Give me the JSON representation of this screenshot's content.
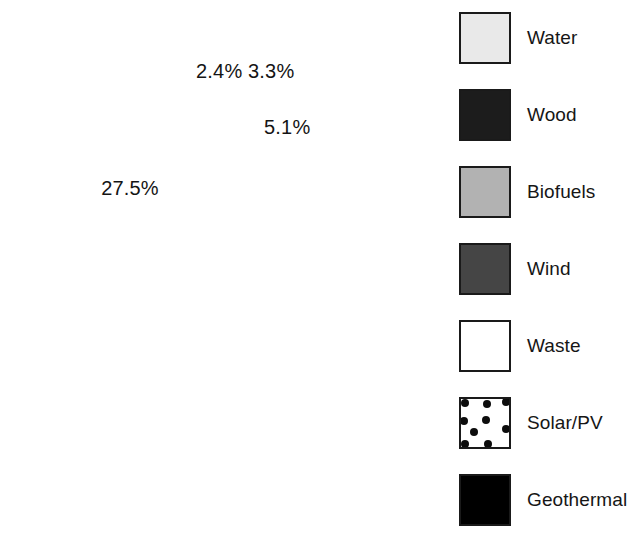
{
  "chart_data": {
    "type": "pie",
    "title": "",
    "categories": [
      "Geothermal",
      "Solar/PV",
      "Waste",
      "Wind",
      "Biofuels",
      "Wood",
      "Water"
    ],
    "values": [
      2.4,
      3.3,
      5.1,
      17.2,
      21.5,
      23.0,
      27.5
    ],
    "value_labels": [
      "2.4%",
      "3.3%",
      "5.1%",
      "17.2%",
      "21.5%",
      "23.0%",
      "27.5%"
    ],
    "unit": "%",
    "start_angle_deg": 0,
    "direction": "clockwise",
    "legend_position": "right",
    "grid": false,
    "slice_colors": [
      "#000000",
      "#ffffff",
      "#ffffff",
      "#454545",
      "#b2b2b2",
      "#1c1c1c",
      "#e9e9e9"
    ],
    "slice_patterns": [
      "solid",
      "dots",
      "solid",
      "solid",
      "solid",
      "solid",
      "solid"
    ],
    "label_text_colors": [
      "#141414",
      "#141414",
      "#141414",
      "#ffffff",
      "#ffffff",
      "#ffffff",
      "#141414"
    ],
    "label_placement": [
      "outside",
      "outside",
      "outside",
      "inside",
      "inside",
      "inside",
      "inside"
    ]
  },
  "pie": {
    "center_x": 211,
    "center_y": 271,
    "radius": 187,
    "outline_color": "#1a1a1a",
    "outside_labels": [
      {
        "name": "geothermal",
        "text": "2.4%",
        "x": 196,
        "y": 60
      },
      {
        "name": "solar-pv",
        "text": "3.3%",
        "x": 248,
        "y": 60
      },
      {
        "name": "waste",
        "text": "5.1%",
        "x": 264,
        "y": 116
      }
    ],
    "inside_labels": [
      {
        "name": "wind",
        "text": "17.2%",
        "x": 300,
        "y": 225,
        "color": "#ffffff"
      },
      {
        "name": "biofuels",
        "text": "21.5%",
        "x": 272,
        "y": 358,
        "color": "#ffffff"
      },
      {
        "name": "wood",
        "text": "23.0%",
        "x": 141,
        "y": 358,
        "color": "#ffffff"
      },
      {
        "name": "water",
        "text": "27.5%",
        "x": 130,
        "y": 195,
        "color": "#141414"
      }
    ]
  },
  "legend": {
    "items": [
      {
        "label": "Water",
        "color": "#e9e9e9",
        "pattern": "solid",
        "top": 10
      },
      {
        "label": "Wood",
        "color": "#1c1c1c",
        "pattern": "solid",
        "top": 87
      },
      {
        "label": "Biofuels",
        "color": "#b2b2b2",
        "pattern": "solid",
        "top": 164
      },
      {
        "label": "Wind",
        "color": "#454545",
        "pattern": "solid",
        "top": 241
      },
      {
        "label": "Waste",
        "color": "#ffffff",
        "pattern": "solid",
        "top": 318
      },
      {
        "label": "Solar/PV",
        "color": "#ffffff",
        "pattern": "dots",
        "top": 395
      },
      {
        "label": "Geothermal",
        "color": "#000000",
        "pattern": "solid",
        "top": 472
      }
    ]
  }
}
